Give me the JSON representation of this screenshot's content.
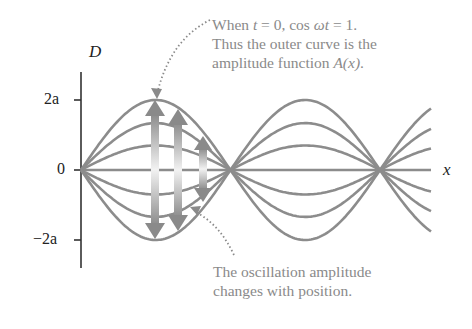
{
  "axes": {
    "y_label": "D",
    "x_label": "x",
    "y_ticks": [
      "2a",
      "0",
      "−2a"
    ]
  },
  "annotations": {
    "top": {
      "line1_prefix": "When ",
      "line1_t": "t",
      "line1_mid": " = 0, cos ",
      "line1_omega_t": "ωt",
      "line1_suffix": " = 1.",
      "line2": "Thus the outer curve is the",
      "line3_prefix": "amplitude function ",
      "line3_func": "A(x)",
      "line3_suffix": "."
    },
    "bottom": {
      "line1": "The oscillation amplitude",
      "line2": "changes with position."
    }
  },
  "colors": {
    "curve": "#8c8c8c",
    "axis": "#333333",
    "annotation_text": "#8a8a8a"
  },
  "chart_data": {
    "type": "line",
    "title": "",
    "xlabel": "x",
    "ylabel": "D",
    "yticks": [
      "-2a",
      "0",
      "2a"
    ],
    "series": [
      {
        "name": "cos wt = 1",
        "amplitude_fraction": 1.0
      },
      {
        "name": "cos wt = 0.67",
        "amplitude_fraction": 0.67
      },
      {
        "name": "cos wt = 0.35",
        "amplitude_fraction": 0.35
      },
      {
        "name": "cos wt = 0",
        "amplitude_fraction": 0.0
      },
      {
        "name": "cos wt = -0.35",
        "amplitude_fraction": -0.35
      },
      {
        "name": "cos wt = -0.67",
        "amplitude_fraction": -0.67
      },
      {
        "name": "cos wt = -1",
        "amplitude_fraction": -1.0
      }
    ],
    "max_amplitude": "2a",
    "nodes_visible": 3,
    "antinodes_visible": 2
  }
}
